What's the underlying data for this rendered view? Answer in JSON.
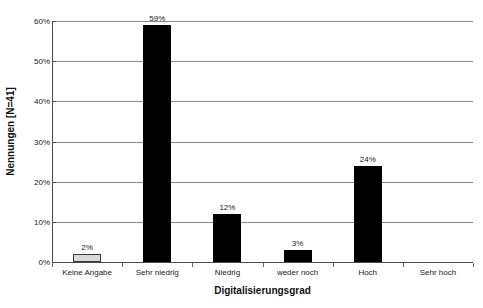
{
  "chart_data": {
    "type": "bar",
    "title": "",
    "subtitle": "",
    "xlabel": "Digitalisierungsgrad",
    "ylabel": "Nennungen [N=41]",
    "categories": [
      "Keine Angabe",
      "Sehr niedrig",
      "Niedrig",
      "weder noch",
      "Hoch",
      "Sehr hoch"
    ],
    "values": [
      2,
      59,
      12,
      3,
      24,
      0
    ],
    "value_labels": [
      "2%",
      "59%",
      "12%",
      "3%",
      "24%",
      ""
    ],
    "bar_styles": [
      "light",
      "solid",
      "solid",
      "solid",
      "solid",
      "none"
    ],
    "ylim": [
      0,
      60
    ],
    "yticks": [
      0,
      10,
      20,
      30,
      40,
      50,
      60
    ],
    "ytick_labels": [
      "0%",
      "10%",
      "20%",
      "30%",
      "40%",
      "50%",
      "60%"
    ],
    "grid": true,
    "grid_axis": "y",
    "legend": false,
    "legend_position": "none",
    "colors": {
      "bar_solid": "#000000",
      "bar_light_fill": "#d9d9d9",
      "bar_light_border": "#3a3a3a",
      "gridline": "#8a8a8a",
      "axis": "#4a4a4a",
      "text": "#1a1a1a",
      "background": "#ffffff"
    }
  }
}
